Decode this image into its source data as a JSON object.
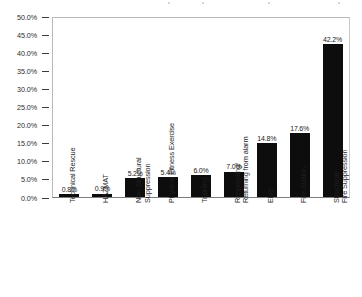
{
  "chart_data": {
    "type": "bar",
    "title": "",
    "xlabel": "",
    "ylabel": "",
    "ylim": [
      0,
      50
    ],
    "grid": false,
    "legend": false,
    "orientation": "vertical",
    "bar_color": "#0d0d0d",
    "categories": [
      "Technical Rescue",
      "HAZMAT",
      "Non-Structural Suppression",
      "Physical Fitness Exercise",
      "Training",
      "Responding/ Returning from alarm",
      "EMS",
      "Fire Station",
      "Structural/ Fire Suppression"
    ],
    "category_lines": [
      [
        "Technical Rescue"
      ],
      [
        "HAZMAT"
      ],
      [
        "Non-Structural",
        "Suppression"
      ],
      [
        "Physical Fitness Exercise"
      ],
      [
        "Training"
      ],
      [
        "Responding/",
        "Returning from alarm"
      ],
      [
        "EMS"
      ],
      [
        "Fire Station"
      ],
      [
        "Structural/",
        "Fire Suppression"
      ]
    ],
    "values": [
      0.8,
      0.9,
      5.2,
      5.4,
      6.0,
      7.0,
      14.8,
      17.6,
      42.2
    ],
    "data_labels": [
      "0.8%",
      "0.9%",
      "5.2%",
      "5.4%",
      "6.0%",
      "7.0%",
      "14.8%",
      "17.6%",
      "42.2%"
    ],
    "yticks": [
      0,
      5,
      10,
      15,
      20,
      25,
      30,
      35,
      40,
      45,
      50
    ],
    "ytick_labels": [
      "0.0%",
      "5.0%",
      "10.0%",
      "15.0%",
      "20.0%",
      "25.0%",
      "30.0%",
      "35.0%",
      "40.0%",
      "45.0%",
      "50.0%"
    ]
  }
}
